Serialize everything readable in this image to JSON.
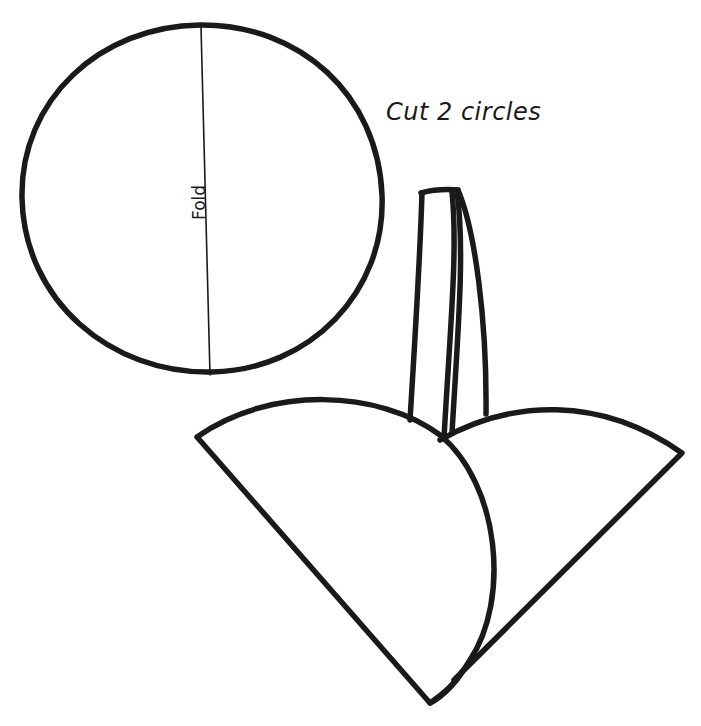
{
  "diagram": {
    "type": "craft-pattern",
    "background": "#ffffff",
    "ink_color": "#1a1a1a",
    "pattern": {
      "shape": "circle",
      "fold_line_label": "Fold"
    },
    "instruction": {
      "text": "Cut 2 circles"
    },
    "assembled_view": {
      "description": "Two circles folded in half, overlapped into a cone-shaped basket with a strip handle",
      "parts": [
        "left-folded-half-circle",
        "right-folded-half-circle",
        "handle-strip"
      ]
    }
  }
}
